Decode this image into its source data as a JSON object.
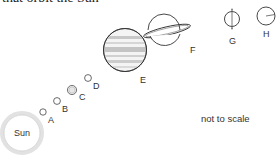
{
  "caption": "that orbit the Sun",
  "note": "not to scale",
  "bodies": {
    "sun": {
      "label": "Sun"
    },
    "a": {
      "label": "A"
    },
    "b": {
      "label": "B"
    },
    "c": {
      "label": "C"
    },
    "d": {
      "label": "D"
    },
    "e": {
      "label": "E"
    },
    "f": {
      "label": "F"
    },
    "g": {
      "label": "G"
    },
    "h": {
      "label": "H"
    }
  },
  "colors": {
    "stroke": "#333333",
    "sun_glow": "#d8d8d8",
    "stripe": "#bdbdbd"
  }
}
